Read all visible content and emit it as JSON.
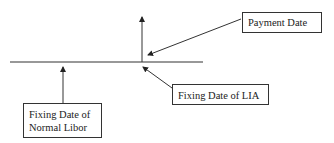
{
  "diagram": {
    "labels": {
      "payment_date": "Payment Date",
      "fixing_date_lia": "Fixing Date of LIA",
      "fixing_date_normal_line1": "Fixing Date of",
      "fixing_date_normal_line2": "Normal Libor"
    },
    "colors": {
      "line": "#333333",
      "text": "#222222",
      "background": "#ffffff"
    }
  }
}
